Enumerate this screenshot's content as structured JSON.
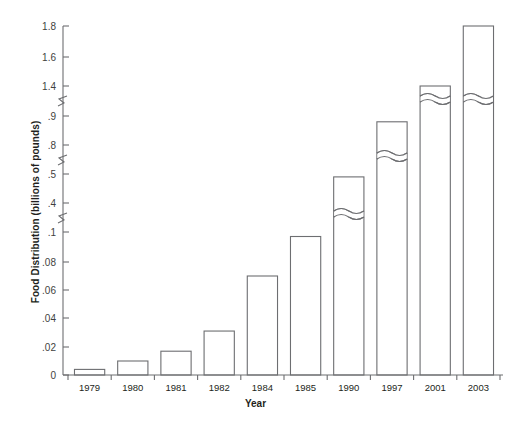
{
  "chart_data": {
    "type": "bar",
    "title": "",
    "xlabel": "Year",
    "ylabel": "Food Distribution (billions of pounds)",
    "categories": [
      "1979",
      "1980",
      "1981",
      "1982",
      "1984",
      "1985",
      "1990",
      "1997",
      "2001",
      "2003"
    ],
    "values": [
      0.004,
      0.01,
      0.017,
      0.031,
      0.07,
      0.097,
      0.49,
      0.88,
      1.4,
      1.8
    ],
    "ytick_labels": [
      "0",
      ".02",
      ".04",
      ".06",
      ".08",
      ".1",
      ".4",
      ".5",
      ".8",
      ".9",
      "1.4",
      "1.6",
      "1.8"
    ],
    "ytick_values": [
      0,
      0.02,
      0.04,
      0.06,
      0.08,
      0.1,
      0.4,
      0.5,
      0.8,
      0.9,
      1.4,
      1.6,
      1.8
    ],
    "axis_breaks": [
      {
        "between": [
          0.1,
          0.4
        ]
      },
      {
        "between": [
          0.5,
          0.8
        ]
      },
      {
        "between": [
          0.9,
          1.4
        ]
      }
    ],
    "bars_with_break_marks": [
      "1990",
      "1997",
      "2001",
      "2003"
    ],
    "grid": false,
    "legend": null,
    "ylim": [
      0,
      1.8
    ],
    "colors": {
      "bar_fill": "#ffffff",
      "bar_stroke": "#6d6e71",
      "axis": "#6d6e71",
      "text": "#231f20",
      "tick_text": "#3f3f40",
      "background": "#ffffff"
    }
  }
}
